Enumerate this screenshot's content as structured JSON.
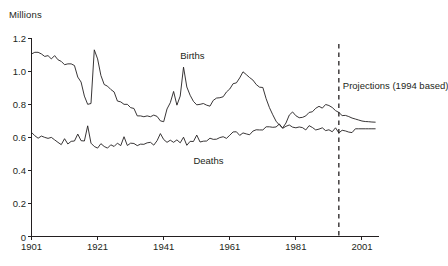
{
  "chart_data": {
    "type": "line",
    "title": "",
    "subtitle": "",
    "xlabel": "",
    "ylabel": "Millions",
    "unit_label": "Millions",
    "xlim": [
      1901,
      2006
    ],
    "ylim": [
      0,
      1.25
    ],
    "grid": false,
    "legend_position": "inline-labels",
    "yticks": [
      "0",
      "0.2",
      "0.4",
      "0.6",
      "0.8",
      "1.0",
      "1.2"
    ],
    "ytick_values": [
      0,
      0.2,
      0.4,
      0.6,
      0.8,
      1.0,
      1.2
    ],
    "xticks": [
      "1901",
      "1921",
      "1941",
      "1961",
      "1981",
      "2001"
    ],
    "xtick_values": [
      1901,
      1921,
      1941,
      1961,
      1981,
      2001
    ],
    "annotations": [
      {
        "name": "projection-divider",
        "text": "Projections (1994 based)",
        "x_value": 1994,
        "style": "dashed-vertical-line"
      }
    ],
    "series": [
      {
        "name": "Births",
        "label": "Births",
        "color": "#231f20",
        "label_x_value": 1946,
        "label_y_value": 1.09,
        "x": [
          1901,
          1902,
          1903,
          1904,
          1905,
          1906,
          1907,
          1908,
          1909,
          1910,
          1911,
          1912,
          1913,
          1914,
          1915,
          1916,
          1917,
          1918,
          1919,
          1920,
          1921,
          1922,
          1923,
          1924,
          1925,
          1926,
          1927,
          1928,
          1929,
          1930,
          1931,
          1932,
          1933,
          1934,
          1935,
          1936,
          1937,
          1938,
          1939,
          1940,
          1941,
          1942,
          1943,
          1944,
          1945,
          1946,
          1947,
          1948,
          1949,
          1950,
          1951,
          1952,
          1953,
          1954,
          1955,
          1956,
          1957,
          1958,
          1959,
          1960,
          1961,
          1962,
          1963,
          1964,
          1965,
          1966,
          1967,
          1968,
          1969,
          1970,
          1971,
          1972,
          1973,
          1974,
          1975,
          1976,
          1977,
          1978,
          1979,
          1980,
          1981,
          1982,
          1983,
          1984,
          1985,
          1986,
          1987,
          1988,
          1989,
          1990,
          1991,
          1992,
          1993,
          1994,
          1995,
          1996,
          1997,
          1998,
          1999,
          2000,
          2001,
          2002,
          2003,
          2004,
          2005
        ],
        "values": [
          1.105,
          1.115,
          1.115,
          1.105,
          1.09,
          1.095,
          1.075,
          1.095,
          1.07,
          1.06,
          1.04,
          1.045,
          1.045,
          1.035,
          0.965,
          0.935,
          0.85,
          0.8,
          0.805,
          1.13,
          1.075,
          0.975,
          0.92,
          0.91,
          0.89,
          0.875,
          0.82,
          0.815,
          0.8,
          0.8,
          0.78,
          0.775,
          0.73,
          0.73,
          0.725,
          0.73,
          0.725,
          0.735,
          0.727,
          0.7,
          0.695,
          0.772,
          0.81,
          0.878,
          0.795,
          0.85,
          1.025,
          0.905,
          0.855,
          0.818,
          0.797,
          0.8,
          0.805,
          0.795,
          0.789,
          0.824,
          0.838,
          0.84,
          0.846,
          0.875,
          0.893,
          0.925,
          0.93,
          0.96,
          0.997,
          0.98,
          0.962,
          0.947,
          0.92,
          0.904,
          0.902,
          0.834,
          0.78,
          0.737,
          0.698,
          0.675,
          0.657,
          0.687,
          0.735,
          0.754,
          0.731,
          0.719,
          0.721,
          0.73,
          0.751,
          0.755,
          0.776,
          0.788,
          0.777,
          0.799,
          0.793,
          0.781,
          0.762,
          0.751,
          0.732,
          0.733,
          0.726,
          0.717,
          0.711,
          0.705,
          0.699,
          0.696,
          0.695,
          0.693,
          0.692
        ]
      },
      {
        "name": "Deaths",
        "label": "Deaths",
        "color": "#231f20",
        "label_x_value": 1950,
        "label_y_value": 0.455,
        "x": [
          1901,
          1902,
          1903,
          1904,
          1905,
          1906,
          1907,
          1908,
          1909,
          1910,
          1911,
          1912,
          1913,
          1914,
          1915,
          1916,
          1917,
          1918,
          1919,
          1920,
          1921,
          1922,
          1923,
          1924,
          1925,
          1926,
          1927,
          1928,
          1929,
          1930,
          1931,
          1932,
          1933,
          1934,
          1935,
          1936,
          1937,
          1938,
          1939,
          1940,
          1941,
          1942,
          1943,
          1944,
          1945,
          1946,
          1947,
          1948,
          1949,
          1950,
          1951,
          1952,
          1953,
          1954,
          1955,
          1956,
          1957,
          1958,
          1959,
          1960,
          1961,
          1962,
          1963,
          1964,
          1965,
          1966,
          1967,
          1968,
          1969,
          1970,
          1971,
          1972,
          1973,
          1974,
          1975,
          1976,
          1977,
          1978,
          1979,
          1980,
          1981,
          1982,
          1983,
          1984,
          1985,
          1986,
          1987,
          1988,
          1989,
          1990,
          1991,
          1992,
          1993,
          1994,
          1995,
          1996,
          1997,
          1998,
          1999,
          2000,
          2001,
          2002,
          2003,
          2004,
          2005
        ],
        "values": [
          0.63,
          0.61,
          0.595,
          0.608,
          0.6,
          0.594,
          0.6,
          0.585,
          0.57,
          0.556,
          0.592,
          0.56,
          0.576,
          0.578,
          0.62,
          0.58,
          0.578,
          0.67,
          0.565,
          0.545,
          0.535,
          0.562,
          0.545,
          0.535,
          0.555,
          0.545,
          0.565,
          0.55,
          0.604,
          0.551,
          0.565,
          0.563,
          0.55,
          0.559,
          0.558,
          0.567,
          0.57,
          0.553,
          0.58,
          0.623,
          0.587,
          0.57,
          0.583,
          0.57,
          0.585,
          0.567,
          0.601,
          0.552,
          0.576,
          0.575,
          0.614,
          0.572,
          0.577,
          0.578,
          0.595,
          0.588,
          0.589,
          0.599,
          0.604,
          0.594,
          0.613,
          0.633,
          0.634,
          0.612,
          0.627,
          0.621,
          0.616,
          0.638,
          0.646,
          0.645,
          0.645,
          0.664,
          0.664,
          0.661,
          0.663,
          0.681,
          0.655,
          0.667,
          0.675,
          0.662,
          0.658,
          0.663,
          0.659,
          0.645,
          0.671,
          0.66,
          0.645,
          0.65,
          0.658,
          0.641,
          0.646,
          0.634,
          0.658,
          0.627,
          0.643,
          0.639,
          0.632,
          0.629,
          0.652,
          0.652,
          0.652,
          0.652,
          0.652,
          0.652,
          0.652
        ]
      }
    ]
  }
}
